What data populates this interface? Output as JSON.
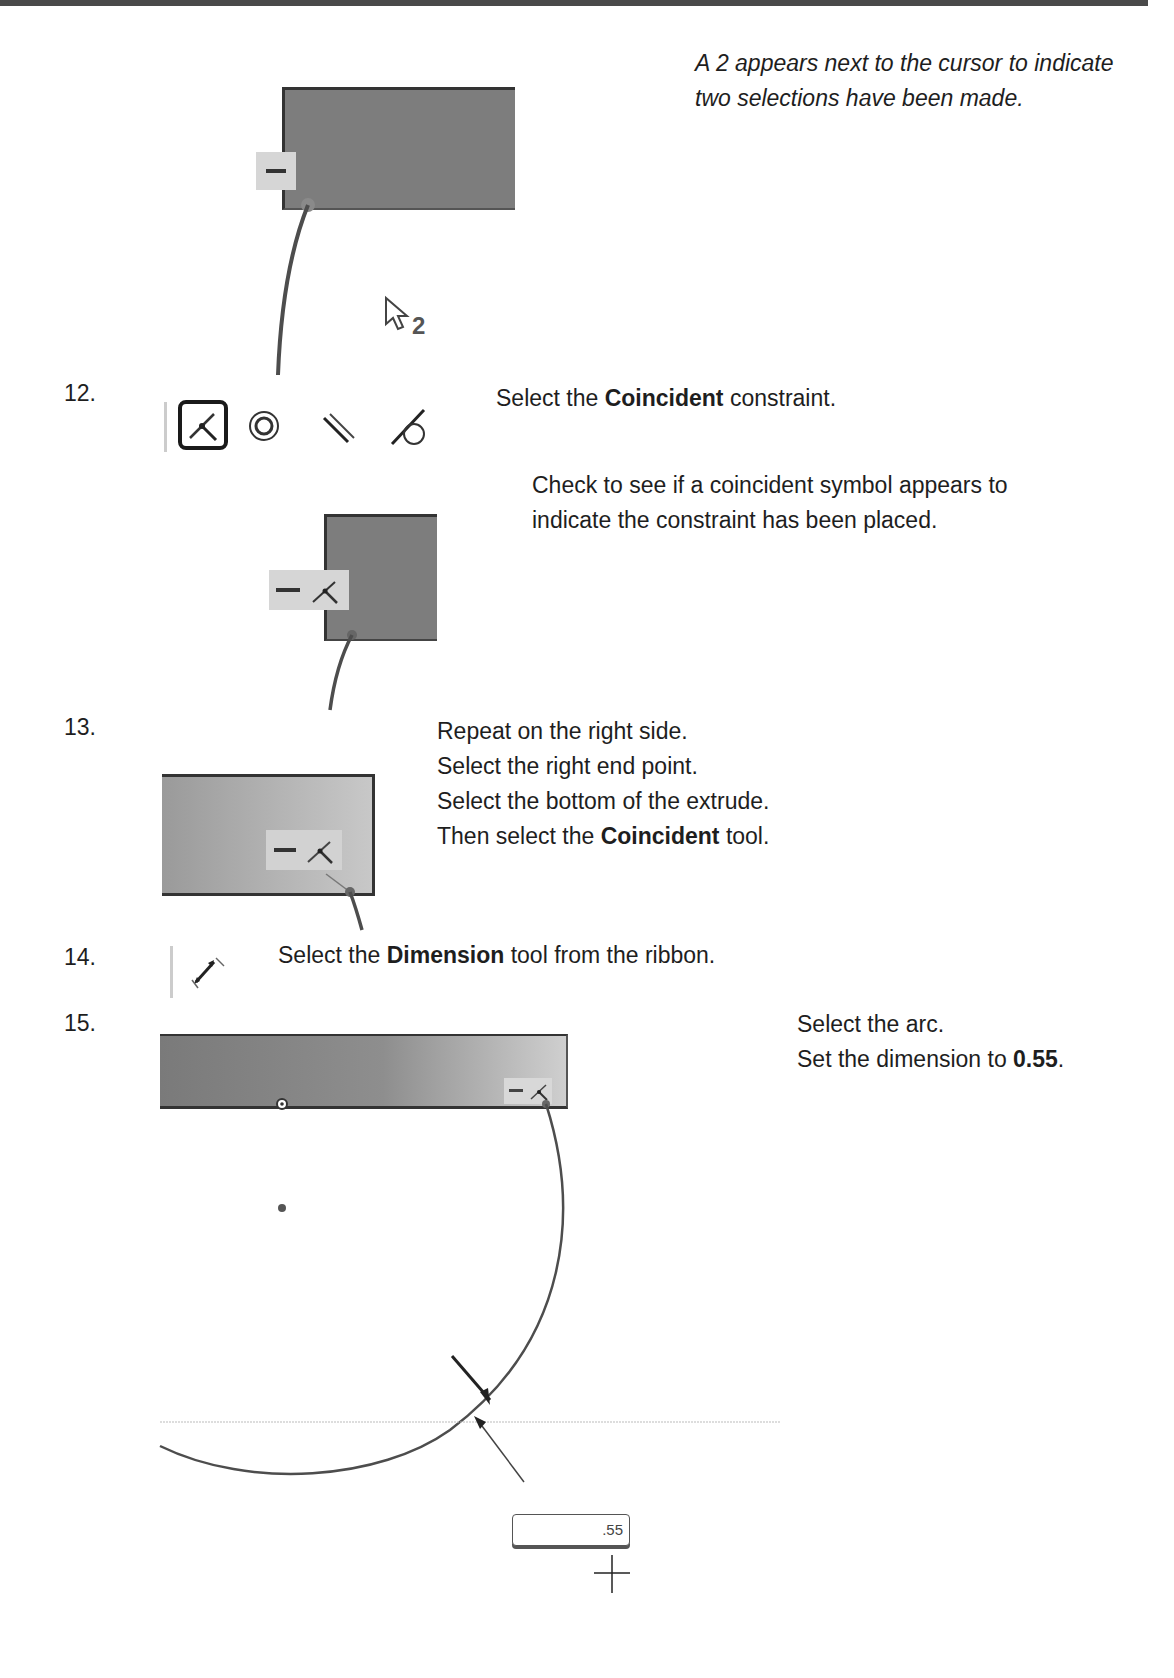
{
  "note_top": "A 2 appears next to the cursor to indicate two selections have been made.",
  "cursor_selection_count": "2",
  "steps": [
    {
      "number": "12.",
      "instruction_pre": "Select the ",
      "instruction_bold": "Coincident",
      "instruction_post": " constraint.",
      "toolbar_icons": [
        "coincident-icon",
        "concentric-icon",
        "parallel-icon",
        "tangent-icon"
      ],
      "selected_icon": "coincident-icon",
      "check_text": "Check to see if a coincident symbol appears to indicate the constraint has been placed."
    },
    {
      "number": "13.",
      "lines": [
        "Repeat on the right side.",
        "Select the right end point.",
        "Select the bottom of the extrude."
      ],
      "last_line_pre": "Then select the ",
      "last_line_bold": "Coincident",
      "last_line_post": " tool."
    },
    {
      "number": "14.",
      "instruction_pre": "Select the ",
      "instruction_bold": "Dimension",
      "instruction_post": " tool from the ribbon.",
      "icon": "dimension-icon"
    },
    {
      "number": "15.",
      "line1": "Select the arc.",
      "line2_pre": "Set the dimension to ",
      "line2_bold": "0.55",
      "line2_post": ".",
      "dimension_input_value": ".55"
    }
  ],
  "constraint_glyphs": {
    "horizontal": "—",
    "coincident": "⅄"
  },
  "colors": {
    "extrude_dark": "#7c7c7c",
    "extrude_light": "#c9c9c9",
    "sketch_line": "#555555",
    "badge_bg": "#d9d9d9"
  }
}
